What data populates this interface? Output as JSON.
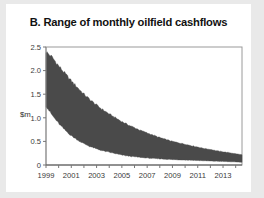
{
  "figure": {
    "title": "B. Range of monthly oilfield cashflows",
    "panel_letter": "B.",
    "background_color": "#e9e9e9",
    "card_color": "#ffffff"
  },
  "chart_data": {
    "type": "area",
    "title": "B. Range of monthly oilfield cashflows",
    "xlabel": "",
    "ylabel": "$m",
    "ylim": [
      0,
      2.5
    ],
    "xlim": [
      1999,
      2014.5
    ],
    "grid": false,
    "legend_position": "none",
    "band_color": "#4a4a4a",
    "frame_color": "#9a9a9a",
    "yticks": [
      0,
      0.5,
      1.0,
      1.5,
      2.0,
      2.5
    ],
    "ytick_labels": [
      "0",
      "0.5",
      "1.0",
      "1.5",
      "2.0",
      "2.5"
    ],
    "xticks": [
      1999,
      2000,
      2001,
      2002,
      2003,
      2004,
      2005,
      2006,
      2007,
      2008,
      2009,
      2010,
      2011,
      2012,
      2013,
      2014
    ],
    "xtick_labels_shown": [
      "1999",
      "2001",
      "2003",
      "2005",
      "2007",
      "2009",
      "2011",
      "2013"
    ],
    "xtick_label_years": [
      1999,
      2001,
      2003,
      2005,
      2007,
      2009,
      2011,
      2013
    ],
    "x": [
      1999.0,
      1999.5,
      2000.0,
      2000.5,
      2001.0,
      2001.5,
      2002.0,
      2002.5,
      2003.0,
      2003.5,
      2004.0,
      2004.5,
      2005.0,
      2005.5,
      2006.0,
      2006.5,
      2007.0,
      2007.5,
      2008.0,
      2008.5,
      2009.0,
      2009.5,
      2010.0,
      2010.5,
      2011.0,
      2011.5,
      2012.0,
      2012.5,
      2013.0,
      2013.5,
      2014.0,
      2014.4
    ],
    "series": [
      {
        "name": "Upper bound of monthly cashflow range",
        "values": [
          2.4,
          2.28,
          2.1,
          1.94,
          1.78,
          1.64,
          1.5,
          1.38,
          1.27,
          1.17,
          1.08,
          1.0,
          0.92,
          0.85,
          0.79,
          0.73,
          0.68,
          0.63,
          0.58,
          0.54,
          0.5,
          0.47,
          0.44,
          0.41,
          0.38,
          0.35,
          0.33,
          0.3,
          0.28,
          0.26,
          0.24,
          0.22
        ]
      },
      {
        "name": "Lower bound of monthly cashflow range",
        "values": [
          1.25,
          1.05,
          0.88,
          0.74,
          0.62,
          0.53,
          0.45,
          0.39,
          0.34,
          0.3,
          0.27,
          0.24,
          0.21,
          0.19,
          0.175,
          0.16,
          0.148,
          0.138,
          0.13,
          0.122,
          0.115,
          0.11,
          0.105,
          0.1,
          0.095,
          0.09,
          0.085,
          0.08,
          0.075,
          0.07,
          0.065,
          0.06
        ]
      }
    ],
    "annotations": []
  }
}
